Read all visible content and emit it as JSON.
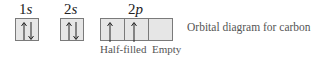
{
  "orbitals": [
    {
      "label_num": "1",
      "label_letter": "s"
    },
    {
      "label_num": "2",
      "label_letter": "s"
    },
    {
      "label_num": "2",
      "label_letter": "p"
    }
  ],
  "boxes": [
    {
      "orbital": "1s",
      "electrons": "up-down"
    },
    {
      "orbital": "2s",
      "electrons": "up-down"
    },
    {
      "orbital": "2p",
      "electrons": "up"
    },
    {
      "orbital": "2p",
      "electrons": "up"
    },
    {
      "orbital": "2p",
      "electrons": "empty"
    }
  ],
  "annotations": {
    "half_filled": "Half-filled",
    "empty": "Empty"
  },
  "caption": "Orbital diagram for carbon"
}
